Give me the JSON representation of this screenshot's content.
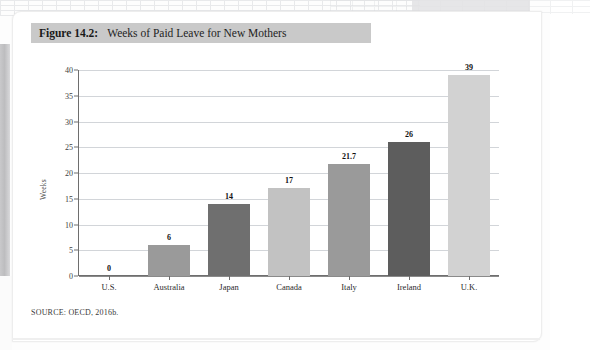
{
  "figure": {
    "number_label": "Figure 14.2:",
    "title": "Weeks of Paid Leave for New Mothers",
    "source": "SOURCE: OECD, 2016b.",
    "banner_color": "#c9c9c9"
  },
  "chart_data": {
    "type": "bar",
    "title": "Weeks of Paid Leave for New Mothers",
    "xlabel": "",
    "ylabel": "Weeks",
    "ylim": [
      0,
      40
    ],
    "ytick_step": 5,
    "yticks": [
      0,
      5,
      10,
      15,
      20,
      25,
      30,
      35,
      40
    ],
    "ytick_labels": [
      "0",
      "5",
      "10",
      "15",
      "20",
      "25",
      "30",
      "35",
      "40"
    ],
    "grid": true,
    "legend": "none",
    "categories": [
      "U.S.",
      "Australia",
      "Japan",
      "Canada",
      "Italy",
      "Ireland",
      "U.K."
    ],
    "values": [
      0,
      6,
      14,
      17,
      21.7,
      26,
      39
    ],
    "data_labels": [
      "0",
      "6",
      "14",
      "17",
      "21.7",
      "26",
      "39"
    ],
    "bar_colors": [
      "#ffffff",
      "#9a9a9a",
      "#6f6f6f",
      "#c2c2c2",
      "#9a9a9a",
      "#5d5d5d",
      "#d2d2d2"
    ],
    "source": "SOURCE: OECD, 2016b."
  }
}
